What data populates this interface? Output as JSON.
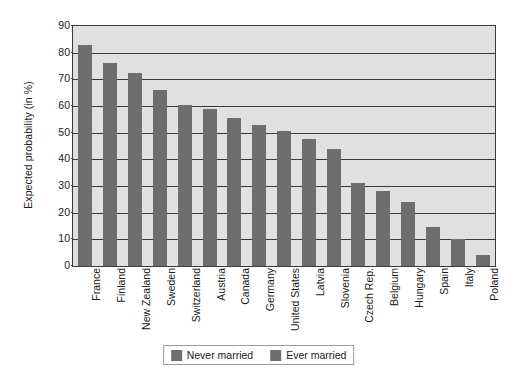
{
  "chart_data": {
    "type": "bar",
    "title": "",
    "subtitle": "",
    "xlabel": "",
    "ylabel": "Expected probability (in %)",
    "ylim": [
      0,
      90
    ],
    "ytick_step": 10,
    "yticks": [
      0,
      10,
      20,
      30,
      40,
      50,
      60,
      70,
      80,
      90
    ],
    "grid": true,
    "legend_position": "bottom-center",
    "categories": [
      "France",
      "Finland",
      "New Zealand",
      "Sweden",
      "Switzerland",
      "Austria",
      "Canada",
      "Germany",
      "United States",
      "Latvia",
      "Slovenia",
      "Czech Rep.",
      "Belgium",
      "Hungary",
      "Spain",
      "Italy",
      "Poland"
    ],
    "series": [
      {
        "name": "Never married",
        "color": "#6e6e6e",
        "values": [
          83,
          76,
          72.5,
          66,
          60.5,
          59,
          55.5,
          53,
          50.5,
          47.5,
          44,
          31,
          28,
          24,
          14.5,
          10,
          4
        ]
      }
    ],
    "legend": [
      {
        "label": "Never married",
        "color": "#6e6e6e"
      },
      {
        "label": "Ever married",
        "color": "#6e6e6e"
      }
    ],
    "colors": {
      "bar": "#6e6e6e",
      "plot_background": "#e0e0e0",
      "axis": "#3a3a3a",
      "text": "#1a1a1a",
      "page_background": "#ffffff"
    }
  }
}
